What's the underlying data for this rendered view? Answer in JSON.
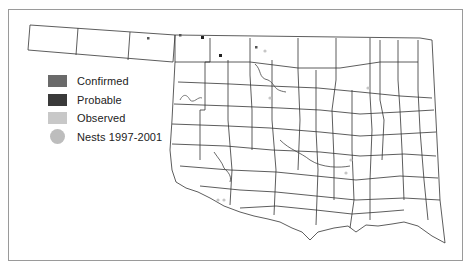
{
  "map": {
    "subject": "Oklahoma county map",
    "frame_border_color": "#9a9a9a",
    "county_line_color": "#333333"
  },
  "legend": {
    "items": [
      {
        "label": "Confirmed",
        "shape": "square",
        "color": "#6a6a6a"
      },
      {
        "label": "Probable",
        "shape": "square",
        "color": "#3a3a3a"
      },
      {
        "label": "Observed",
        "shape": "square",
        "color": "#c8c8c8"
      },
      {
        "label": "Nests 1997-2001",
        "shape": "circle",
        "color": "#bdbdbd"
      }
    ]
  },
  "markers": {
    "confirmed": [
      [
        148,
        38
      ],
      [
        180,
        35
      ],
      [
        256,
        47
      ]
    ],
    "probable": [
      [
        202,
        37
      ],
      [
        220,
        55
      ]
    ],
    "observed": [
      [
        265,
        51
      ],
      [
        270,
        98
      ],
      [
        293,
        145
      ],
      [
        351,
        160
      ],
      [
        346,
        173
      ],
      [
        218,
        200
      ],
      [
        224,
        200
      ],
      [
        330,
        224
      ],
      [
        368,
        88
      ]
    ]
  }
}
